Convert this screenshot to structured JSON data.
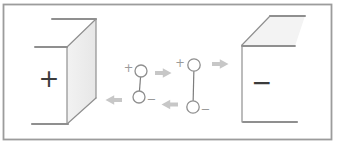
{
  "figure": {
    "caption": ""
  },
  "colors": {
    "background": "#ffffff",
    "frame": "#9c9c9c",
    "line": "#8f8f8f",
    "line_thin": "#9a9a9a",
    "bond": "#7d7d7d",
    "plate_shade": "#e9e9e9",
    "plate_shade_light": "#f3f3f3",
    "sign_dark": "#3b3b3b",
    "charge_label": "#9a9a9a",
    "arrow": "#c7c7c7"
  },
  "plates": {
    "left": {
      "sign": "+"
    },
    "right": {
      "sign": "−"
    }
  },
  "dipoles": [
    {
      "plus": "+",
      "minus": "−"
    },
    {
      "plus": "+",
      "minus": "−"
    }
  ]
}
